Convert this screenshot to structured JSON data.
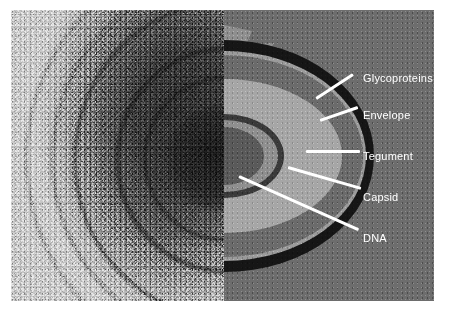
{
  "figure": {
    "background_color": "#ffffff",
    "plate_background": "#6d6d6d"
  },
  "panels": {
    "left": {
      "name": "electron-micrograph",
      "description": "Grainy transmission electron micrograph of a virion showing concentric membrane layers and a dark core"
    },
    "right": {
      "name": "schematic-diagram",
      "description": "Half-section cutaway schematic of the virion with concentric labelled layers"
    }
  },
  "diagram": {
    "layers": [
      {
        "id": "glycoproteins",
        "label": "Glycoproteins",
        "color": "#8f8f8f",
        "shape": "scalloped-spikes"
      },
      {
        "id": "envelope",
        "label": "Envelope",
        "color": "#161616",
        "shape": "ring"
      },
      {
        "id": "tegument",
        "label": "Tegument",
        "color": "#9b9b9b",
        "shape": "ring"
      },
      {
        "id": "capsid",
        "label": "Capsid",
        "color": "#3a3a3a",
        "shape": "ring"
      },
      {
        "id": "dna",
        "label": "DNA",
        "color": "#5a5a5a",
        "shape": "core"
      }
    ]
  },
  "labels": [
    {
      "id": "glycoproteins",
      "text": "Glycoproteins",
      "x": 363,
      "y": 68,
      "leader": {
        "x": 316,
        "y": 97,
        "length": 44,
        "angle": -33
      }
    },
    {
      "id": "envelope",
      "text": "Envelope",
      "x": 363,
      "y": 105,
      "leader": {
        "x": 320,
        "y": 119,
        "length": 40,
        "angle": -19
      }
    },
    {
      "id": "tegument",
      "text": "Tegument",
      "x": 363,
      "y": 146,
      "leader": {
        "x": 306,
        "y": 150,
        "length": 54,
        "angle": 0
      }
    },
    {
      "id": "capsid",
      "text": "Capsid",
      "x": 363,
      "y": 187,
      "leader": {
        "x": 288,
        "y": 166,
        "length": 76,
        "angle": 16
      }
    },
    {
      "id": "dna",
      "text": "DNA",
      "x": 363,
      "y": 228,
      "leader": {
        "x": 239,
        "y": 175,
        "length": 131,
        "angle": 24
      }
    }
  ],
  "text_style": {
    "color": "#ffffff",
    "font_size_px": 11
  }
}
